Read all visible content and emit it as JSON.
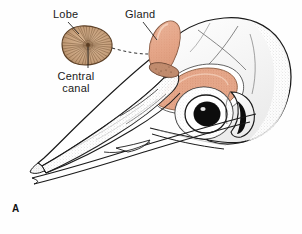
{
  "figure": {
    "panel_letter": "A",
    "background_color": "#fefefe"
  },
  "labels": {
    "lobe": "Lobe",
    "gland": "Gland",
    "central_canal_line1": "Central",
    "central_canal_line2": "canal"
  },
  "colors": {
    "gland_fill": "#e4a385",
    "gland_fill_light": "#efc0aa",
    "lobe_fill": "#c29a77",
    "lobe_fill_light": "#d8b696",
    "outline": "#1a1a1a",
    "stipple": "#9a9a9a",
    "eye_pupil": "#0d0d0d",
    "bone_white": "#ffffff",
    "shadow_grey": "#c8c8c8"
  },
  "structures": [
    {
      "name": "lobe-inset",
      "label": "Lobe",
      "description": "cross-sectioned gland lobe with radiating striations"
    },
    {
      "name": "central-canal",
      "label": "Central canal",
      "description": "convergence point of radiating tubules at lobe centre"
    },
    {
      "name": "gland-cutaway",
      "label": "Gland",
      "description": "cut segment of supraorbital salt gland"
    },
    {
      "name": "gland-in-situ",
      "label": "Gland",
      "description": "crescent-shaped salt gland in supraorbital groove"
    },
    {
      "name": "eye",
      "label": "Eye",
      "description": "orbit with dark pupil and pale sclera ring"
    },
    {
      "name": "upper-mandible",
      "label": "Upper mandible",
      "description": "elongated upper bill"
    },
    {
      "name": "lower-mandible",
      "label": "Lower mandible",
      "description": "elongated lower bill"
    },
    {
      "name": "cranium",
      "label": "Cranium",
      "description": "rounded braincase"
    },
    {
      "name": "ear-opening",
      "label": "Ear opening",
      "description": "dark aperture behind the orbit"
    }
  ],
  "leader_lines": [
    {
      "name": "lobe-leader",
      "from": "Lobe",
      "to": "lobe-inset"
    },
    {
      "name": "central-canal-leader",
      "from": "Central canal",
      "to": "lobe-centre"
    },
    {
      "name": "gland-leader",
      "from": "Gland",
      "to": "gland-cutaway"
    },
    {
      "name": "lobe-to-gland-dashed",
      "from": "lobe-inset",
      "to": "gland-cutaway",
      "style": "dashed"
    }
  ]
}
